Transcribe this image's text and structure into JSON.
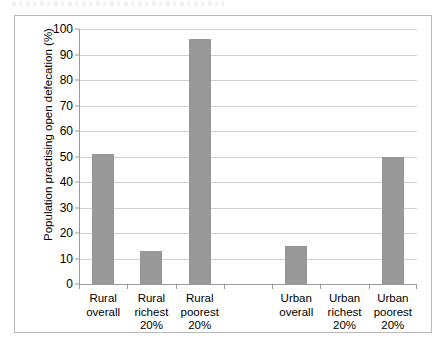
{
  "chart_data": {
    "type": "bar",
    "title": "",
    "xlabel": "",
    "ylabel": "Population practising open defecation (%)",
    "ylim": [
      0,
      100
    ],
    "ytick_step": 10,
    "yticks": [
      100,
      90,
      80,
      70,
      60,
      50,
      40,
      30,
      20,
      10,
      0
    ],
    "grid": true,
    "legend": "none",
    "bar_color": "#999999",
    "categories": [
      "Rural overall",
      "Rural richest 20%",
      "Rural poorest 20%",
      "",
      "Urban overall",
      "Urban richest 20%",
      "Urban poorest 20%"
    ],
    "category_lines": [
      [
        "Rural",
        "overall"
      ],
      [
        "Rural",
        "richest",
        "20%"
      ],
      [
        "Rural",
        "poorest",
        "20%"
      ],
      [],
      [
        "Urban",
        "overall"
      ],
      [
        "Urban",
        "richest",
        "20%"
      ],
      [
        "Urban",
        "poorest",
        "20%"
      ]
    ],
    "values": [
      51,
      13,
      96,
      0,
      15,
      0,
      50
    ]
  }
}
